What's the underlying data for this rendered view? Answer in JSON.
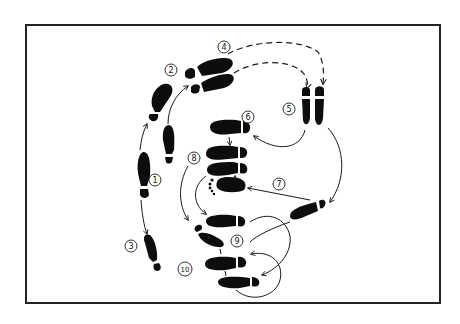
{
  "diagram": {
    "type": "dance-step-footprint-diagram",
    "background": "#ffffff",
    "ink_color": "#0d0d0d",
    "frame": {
      "x": 26,
      "y": 25,
      "width": 414,
      "height": 278
    },
    "steps": [
      {
        "number": "1",
        "label_pos": [
          155,
          180
        ]
      },
      {
        "number": "2",
        "label_pos": [
          171,
          70
        ]
      },
      {
        "number": "3",
        "label_pos": [
          131,
          246
        ]
      },
      {
        "number": "4",
        "label_pos": [
          224,
          47
        ]
      },
      {
        "number": "5",
        "label_pos": [
          289,
          109
        ]
      },
      {
        "number": "6",
        "label_pos": [
          248,
          117
        ]
      },
      {
        "number": "7",
        "label_pos": [
          279,
          184
        ]
      },
      {
        "number": "8",
        "label_pos": [
          194,
          158
        ]
      },
      {
        "number": "9",
        "label_pos": [
          237,
          241
        ]
      },
      {
        "number": "10",
        "label_pos": [
          185,
          269
        ]
      }
    ],
    "path_styles": {
      "solid": "movement arrow",
      "dashed": "travel arrow (step 4 to 5)"
    }
  }
}
